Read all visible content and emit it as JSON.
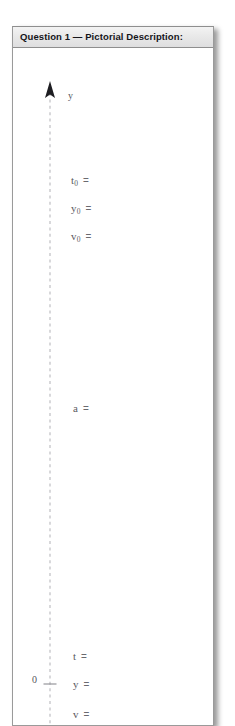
{
  "panel": {
    "title": "Question 1 — Pictorial Description:"
  },
  "diagram": {
    "axis": {
      "name": "vertical-y-axis",
      "label": "y",
      "origin_label": "0",
      "style": "dashed",
      "color": "#b5b5ba",
      "arrow_direction": "up"
    },
    "variables": [
      {
        "name": "t0",
        "symbol": "t",
        "subscript": "0",
        "equals": "=",
        "value": "",
        "top": 126
      },
      {
        "name": "y0",
        "symbol": "y",
        "subscript": "0",
        "equals": "=",
        "value": "",
        "top": 154
      },
      {
        "name": "v0",
        "symbol": "v",
        "subscript": "0",
        "equals": "=",
        "value": "",
        "top": 182
      },
      {
        "name": "a",
        "symbol": "a",
        "subscript": "",
        "equals": "=",
        "value": "",
        "top": 354
      },
      {
        "name": "t",
        "symbol": "t",
        "subscript": "",
        "equals": "=",
        "value": "",
        "top": 602
      },
      {
        "name": "y",
        "symbol": "y",
        "subscript": "",
        "equals": "=",
        "value": "",
        "top": 630
      },
      {
        "name": "v",
        "symbol": "v",
        "subscript": "",
        "equals": "=",
        "value": "",
        "top": 660
      }
    ]
  },
  "colors": {
    "panel_border": "#9a9a9a",
    "header_bg": "#e9e9e9",
    "title_text": "#15151a",
    "label_text": "#5b5b61",
    "axis_line": "#b5b5ba",
    "page_bg": "#ffffff"
  }
}
